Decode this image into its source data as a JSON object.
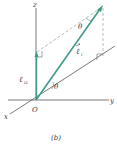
{
  "figure": {
    "caption": "(b)",
    "axes": {
      "x_label": "x",
      "y_label": "y",
      "z_label": "z",
      "origin_label": "O"
    },
    "vector": {
      "label": "ℓ",
      "label_subscript": "i",
      "component_label": "ℓ",
      "component_subscript": "iz"
    },
    "angles": {
      "top_label": "θ",
      "bottom_label": "θ"
    },
    "colors": {
      "vector": "#3f9a8a",
      "axes": "#555555",
      "dashed": "#aaaaaa",
      "text": "#3a3a3a"
    }
  }
}
